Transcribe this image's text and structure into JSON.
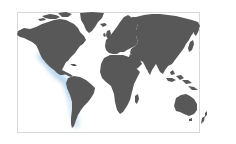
{
  "map": {
    "title": "World map",
    "projection": "equirectangular",
    "colors": {
      "background": "#ffffff",
      "frame_border": "#d8d8d8",
      "land": "#585858",
      "highlight": "#a9cdea",
      "highlight_glow": "#cfe3f4"
    },
    "highlighted_region": {
      "label": "Pacific coast of the Americas",
      "description": "Light blue glow along western coast from Mexico through Central America to Peru/Chile"
    },
    "regions": [
      {
        "name": "North America"
      },
      {
        "name": "Greenland"
      },
      {
        "name": "South America"
      },
      {
        "name": "Europe"
      },
      {
        "name": "Africa"
      },
      {
        "name": "Asia"
      },
      {
        "name": "Australia"
      },
      {
        "name": "New Zealand"
      }
    ]
  }
}
